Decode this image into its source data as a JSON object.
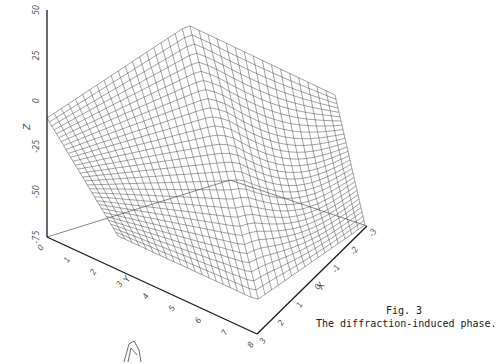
{
  "caption": {
    "figure_number": "Fig. 3",
    "title": "The diffraction-induced phase."
  },
  "chart_data": {
    "type": "surface3d",
    "title": "The diffraction-induced phase.",
    "figure_label": "Fig. 3",
    "axes": {
      "z": {
        "label": "Z",
        "ticks": [
          "50",
          "25",
          "0",
          "-25",
          "-50",
          "-75"
        ],
        "range": [
          -75,
          50
        ]
      },
      "y": {
        "label": "Y",
        "ticks": [
          "0",
          "1",
          "2",
          "3",
          "4",
          "5",
          "6",
          "7",
          "8"
        ],
        "range": [
          0,
          8
        ]
      },
      "x": {
        "label": "X",
        "ticks": [
          "3",
          "2",
          "1",
          "0",
          "-1",
          "-2",
          "-3"
        ],
        "range": [
          -3,
          3
        ]
      }
    },
    "grid": false
  },
  "geometry": {
    "origin": [
      47,
      237
    ],
    "z_top": [
      47,
      10
    ],
    "y_end": [
      257,
      334
    ],
    "x_end": [
      367,
      226
    ],
    "surface": {
      "apex": [
        188,
        25
      ],
      "left": [
        47,
        118
      ],
      "front": [
        257,
        300
      ],
      "right_peak": [
        335,
        95
      ],
      "right_end": [
        365,
        225
      ]
    }
  },
  "colors": {
    "ink": "#1a1a1a",
    "mesh": "#333333",
    "background": "#ffffff"
  }
}
